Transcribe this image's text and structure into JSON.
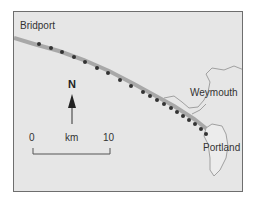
{
  "map": {
    "places": [
      {
        "name": "Bridport"
      },
      {
        "name": "Weymouth"
      },
      {
        "name": "Portland"
      }
    ],
    "north_label": "N",
    "scale": {
      "start": "0",
      "unit": "km",
      "end": "10"
    },
    "colors": {
      "land": "#e6e6e6",
      "coast": "#9a9a9a",
      "route": "#333333",
      "frame": "#6e6e6e"
    }
  }
}
